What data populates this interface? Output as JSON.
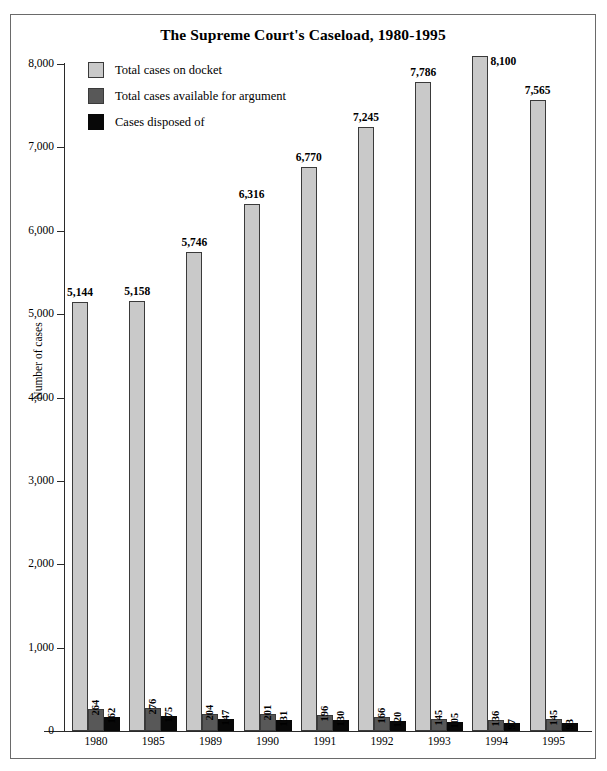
{
  "chart_data": {
    "type": "bar",
    "title": "The Supreme Court's Caseload, 1980-1995",
    "xlabel": "",
    "ylabel": "Number of cases",
    "ylim": [
      0,
      8000
    ],
    "ytick_values": [
      0,
      1000,
      2000,
      3000,
      4000,
      5000,
      6000,
      7000,
      8000
    ],
    "ytick_labels": [
      "0",
      "1,000",
      "2,000",
      "3,000",
      "4,000",
      "5,000",
      "6,000",
      "7,000",
      "8,000"
    ],
    "grid": false,
    "legend_position": "upper-left-inside",
    "categories": [
      "1980",
      "1985",
      "1989",
      "1990",
      "1991",
      "1992",
      "1993",
      "1994",
      "1995"
    ],
    "series": [
      {
        "name": "Total cases on docket",
        "color": "#c9c9c9",
        "values": [
          5144,
          5158,
          5746,
          6316,
          6770,
          7245,
          7786,
          8100,
          7565
        ],
        "labels": [
          "5,144",
          "5,158",
          "5,746",
          "6,316",
          "6,770",
          "7,245",
          "7,786",
          "8,100",
          "7,565"
        ]
      },
      {
        "name": "Total cases available for argument",
        "color": "#585858",
        "values": [
          264,
          276,
          204,
          201,
          196,
          166,
          145,
          136,
          145
        ],
        "labels": [
          "264",
          "276",
          "204",
          "201",
          "196",
          "166",
          "145",
          "136",
          "145"
        ]
      },
      {
        "name": "Cases disposed of",
        "color": "#080808",
        "values": [
          162,
          175,
          147,
          131,
          130,
          120,
          105,
          97,
          93
        ],
        "labels": [
          "162",
          "175",
          "147",
          "131",
          "130",
          "120",
          "105",
          "97",
          "93"
        ]
      }
    ]
  },
  "legend": {
    "items": [
      {
        "label": "Total cases on docket",
        "swatch": "light-gray-swatch"
      },
      {
        "label": "Total cases available for argument",
        "swatch": "dark-gray-swatch"
      },
      {
        "label": "Cases disposed of",
        "swatch": "black-swatch"
      }
    ]
  }
}
